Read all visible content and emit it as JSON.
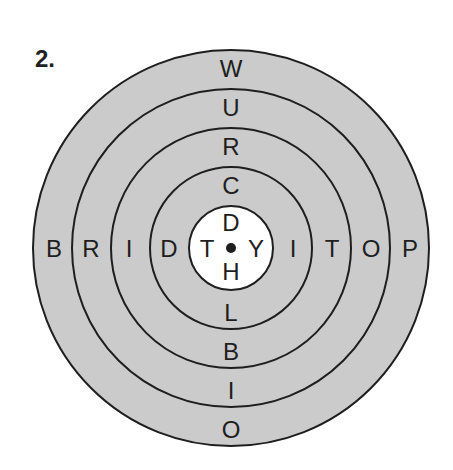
{
  "puzzle": {
    "number_label": "2.",
    "center": {
      "x": 231,
      "y": 248
    },
    "ring_radii": [
      198,
      159,
      120,
      81,
      42
    ],
    "fill_color": "#cbcbcb",
    "inner_fill_color": "#ffffff",
    "line_color": "#1e1e1e",
    "column_top_to_center": [
      "W",
      "U",
      "R",
      "C",
      "D"
    ],
    "column_center_to_bottom": [
      "H",
      "L",
      "B",
      "I",
      "O"
    ],
    "row_left_to_center": [
      "B",
      "R",
      "I",
      "D",
      "T"
    ],
    "row_center_to_right": [
      "Y",
      "I",
      "T",
      "O",
      "P"
    ],
    "center_dot": "center-dot"
  }
}
